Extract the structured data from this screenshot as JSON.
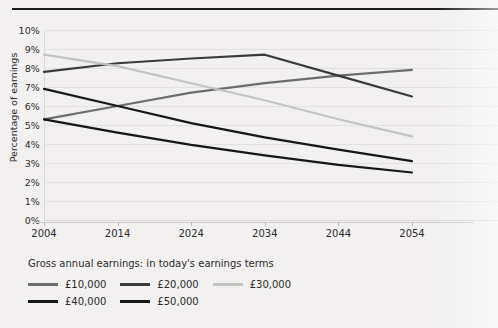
{
  "chart_data": {
    "type": "line",
    "title": "",
    "xlabel": "",
    "ylabel": "Percentage of earnings",
    "x": [
      2004,
      2014,
      2024,
      2034,
      2044,
      2054
    ],
    "xtick_labels": [
      "2004",
      "2014",
      "2024",
      "2034",
      "2044",
      "2054"
    ],
    "ytick_labels": [
      "0%",
      "1%",
      "2%",
      "3%",
      "4%",
      "5%",
      "6%",
      "7%",
      "8%",
      "9%",
      "10%"
    ],
    "ytick_values": [
      0,
      1,
      2,
      3,
      4,
      5,
      6,
      7,
      8,
      9,
      10
    ],
    "ylim": [
      0,
      10
    ],
    "grid": true,
    "legend_position": "bottom-left",
    "legend_title": "Gross annual earnings: in today's earnings terms",
    "series": [
      {
        "name": "£10,000",
        "color": "#6d6d6b",
        "values": [
          5.3,
          6.0,
          6.7,
          7.2,
          7.6,
          7.9
        ]
      },
      {
        "name": "£20,000",
        "color": "#3a3a38",
        "values": [
          7.8,
          8.25,
          8.5,
          8.7,
          7.6,
          6.5
        ]
      },
      {
        "name": "£30,000",
        "color": "#c3c3c1",
        "values": [
          8.7,
          8.1,
          7.2,
          6.3,
          5.3,
          4.4
        ]
      },
      {
        "name": "£40,000",
        "color": "#17171a",
        "values": [
          6.9,
          6.0,
          5.1,
          4.35,
          3.7,
          3.1
        ]
      },
      {
        "name": "£50,000",
        "color": "#17171a",
        "values": [
          5.3,
          4.6,
          3.95,
          3.4,
          2.9,
          2.5
        ]
      }
    ]
  },
  "legend": {
    "title": "Gross annual earnings: in today's earnings terms",
    "rows": [
      [
        {
          "label": "£10,000",
          "color": "#6d6d6b"
        },
        {
          "label": "£20,000",
          "color": "#3a3a38"
        },
        {
          "label": "£30,000",
          "color": "#c3c3c1"
        }
      ],
      [
        {
          "label": "£40,000",
          "color": "#17171a"
        },
        {
          "label": "£50,000",
          "color": "#17171a"
        }
      ]
    ]
  },
  "colors": {
    "background": "#f2f1ef",
    "rule": "#1d1d1b",
    "gridline": "#e2e1df",
    "text": "#2b2b28"
  }
}
